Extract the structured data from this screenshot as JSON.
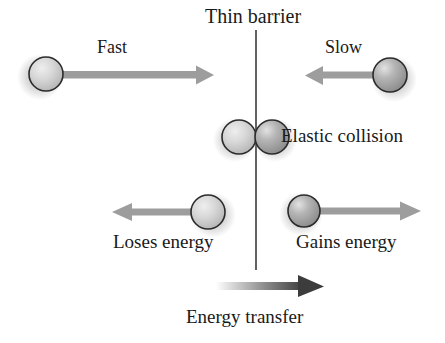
{
  "diagram": {
    "title": "Thin barrier",
    "type": "physics-collision-illustration",
    "canvas": {
      "width": 445,
      "height": 343,
      "background": "#ffffff"
    },
    "barrier": {
      "label": "Thin barrier",
      "x": 256,
      "y_top": 30,
      "y_bottom": 270,
      "color": "#3a3a3a"
    },
    "labels": {
      "fast": "Fast",
      "slow": "Slow",
      "elastic_collision": "Elastic collision",
      "loses_energy": "Loses energy",
      "gains_energy": "Gains energy",
      "energy_transfer": "Energy transfer"
    },
    "colors": {
      "arrow_gray": "#9a9a9a",
      "arrow_dark": "#3c3c3c",
      "ball_light_fill": "#d2d2d2",
      "ball_dark_fill": "#9c9c9c",
      "ball_outline": "#2b2b2b",
      "text": "#1a1a1a"
    },
    "balls": [
      {
        "name": "fast-incoming-ball",
        "cx": 45,
        "cy": 74,
        "r": 17,
        "shade": "light"
      },
      {
        "name": "slow-incoming-ball",
        "cx": 390,
        "cy": 75,
        "r": 17,
        "shade": "dark"
      },
      {
        "name": "collision-ball-left",
        "cx": 239,
        "cy": 137,
        "r": 17,
        "shade": "light"
      },
      {
        "name": "collision-ball-right",
        "cx": 272,
        "cy": 137,
        "r": 17,
        "shade": "dark"
      },
      {
        "name": "loses-energy-ball",
        "cx": 208,
        "cy": 212,
        "r": 17,
        "shade": "light"
      },
      {
        "name": "gains-energy-ball",
        "cx": 304,
        "cy": 211,
        "r": 16,
        "shade": "dark"
      }
    ],
    "arrows": [
      {
        "name": "fast-arrow",
        "direction": "right",
        "x1": 60,
        "x2": 212,
        "y": 75,
        "style": "flat-gray"
      },
      {
        "name": "slow-arrow",
        "direction": "left",
        "x1": 372,
        "x2": 305,
        "y": 75,
        "style": "flat-gray"
      },
      {
        "name": "loses-energy-arrow",
        "direction": "left",
        "x1": 200,
        "x2": 112,
        "y": 212,
        "style": "flat-gray"
      },
      {
        "name": "gains-energy-arrow",
        "direction": "right",
        "x1": 312,
        "x2": 420,
        "y": 211,
        "style": "flat-gray"
      },
      {
        "name": "energy-transfer-arrow",
        "direction": "right",
        "x1": 218,
        "x2": 322,
        "y": 286,
        "style": "gradient-light-to-dark"
      }
    ]
  }
}
